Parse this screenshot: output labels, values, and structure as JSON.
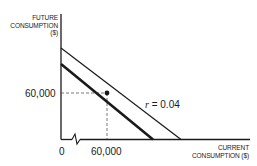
{
  "diagram": {
    "y_axis_label_lines": [
      "FUTURE",
      "CONSUMPTION",
      "($)"
    ],
    "x_axis_label_lines": [
      "CURRENT",
      "CONSUMPTION ($)"
    ],
    "origin_label": "0",
    "x_tick_label": "60,000",
    "y_tick_label": "60,000",
    "line_label_var": "r",
    "line_label_rest": " = 0.04",
    "colors": {
      "line": "#1a1a1a",
      "dashed": "#555555",
      "background": "#ffffff"
    }
  }
}
